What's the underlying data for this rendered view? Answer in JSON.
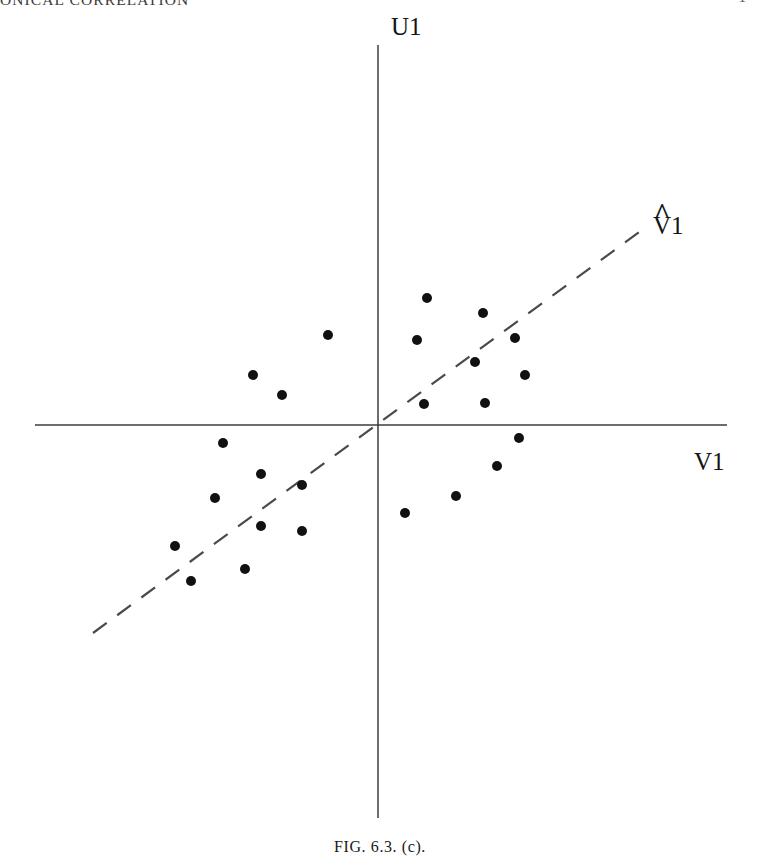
{
  "page": {
    "running_header": "ONICAL CORRELATION",
    "page_number": "1",
    "background_color": "#ffffff",
    "ink_color": "#141414"
  },
  "figure": {
    "caption": "FIG. 6.3.  (c).",
    "axes": {
      "vertical_axis_label": "U1",
      "horizontal_axis_label": "V1",
      "axis_color": "#3c3c3c",
      "origin": {
        "x": 378,
        "y": 425
      },
      "vertical_axis": {
        "x": 378,
        "y_top": 45,
        "y_bottom": 818
      },
      "horizontal_axis": {
        "y": 425,
        "x_left": 35,
        "x_right": 727
      }
    },
    "fitted_line": {
      "label": "V̂1",
      "label_base": "V",
      "label_hat": "^",
      "label_subscript": "1",
      "style": "dashed",
      "color": "#4a4a4a",
      "x1": 93,
      "y1": 633,
      "x2": 642,
      "y2": 230
    }
  },
  "chart_data": {
    "type": "scatter",
    "title": "FIG. 6.3.  (c).",
    "xlabel": "V1",
    "ylabel": "U1",
    "grid": false,
    "legend": null,
    "axis_origin_px": {
      "x": 378,
      "y": 425
    },
    "xlim_px": [
      35,
      727
    ],
    "ylim_px": [
      45,
      818
    ],
    "marker": {
      "shape": "circle",
      "radius": 5.0,
      "color": "#111111"
    },
    "annotations": [
      {
        "text": "U1",
        "x": 391,
        "y": 14,
        "role": "vertical-axis-label"
      },
      {
        "text": "V1",
        "x": 694,
        "y": 449,
        "role": "horizontal-axis-label"
      },
      {
        "text": "V̂1",
        "x": 653,
        "y": 213,
        "role": "fitted-direction-label"
      }
    ],
    "reference_lines": [
      {
        "name": "V-hat-1 direction",
        "style": "dashed",
        "points_px": [
          [
            93,
            633
          ],
          [
            642,
            230
          ]
        ]
      }
    ],
    "points_px": [
      [
        427,
        298
      ],
      [
        483,
        313
      ],
      [
        417,
        340
      ],
      [
        515,
        338
      ],
      [
        328,
        335
      ],
      [
        475,
        362
      ],
      [
        525,
        375
      ],
      [
        253,
        375
      ],
      [
        424,
        404
      ],
      [
        485,
        403
      ],
      [
        282,
        395
      ],
      [
        223,
        443
      ],
      [
        519,
        438
      ],
      [
        215,
        498
      ],
      [
        302,
        485
      ],
      [
        261,
        474
      ],
      [
        497,
        466
      ],
      [
        456,
        496
      ],
      [
        261,
        526
      ],
      [
        302,
        531
      ],
      [
        405,
        513
      ],
      [
        175,
        546
      ],
      [
        245,
        569
      ],
      [
        191,
        581
      ]
    ],
    "points": [
      {
        "x": 49,
        "y": 127
      },
      {
        "x": 105,
        "y": 112
      },
      {
        "x": 39,
        "y": 85
      },
      {
        "x": 137,
        "y": 87
      },
      {
        "x": -50,
        "y": 90
      },
      {
        "x": 97,
        "y": 63
      },
      {
        "x": 147,
        "y": 50
      },
      {
        "x": -125,
        "y": 50
      },
      {
        "x": 46,
        "y": 21
      },
      {
        "x": 107,
        "y": 22
      },
      {
        "x": -96,
        "y": 30
      },
      {
        "x": -155,
        "y": -18
      },
      {
        "x": 141,
        "y": -13
      },
      {
        "x": -163,
        "y": -73
      },
      {
        "x": -76,
        "y": -60
      },
      {
        "x": -117,
        "y": -49
      },
      {
        "x": 119,
        "y": -41
      },
      {
        "x": 78,
        "y": -71
      },
      {
        "x": -117,
        "y": -101
      },
      {
        "x": -76,
        "y": -106
      },
      {
        "x": 27,
        "y": -88
      },
      {
        "x": -203,
        "y": -121
      },
      {
        "x": -133,
        "y": -144
      },
      {
        "x": -187,
        "y": -156
      }
    ],
    "n_points": 24
  }
}
